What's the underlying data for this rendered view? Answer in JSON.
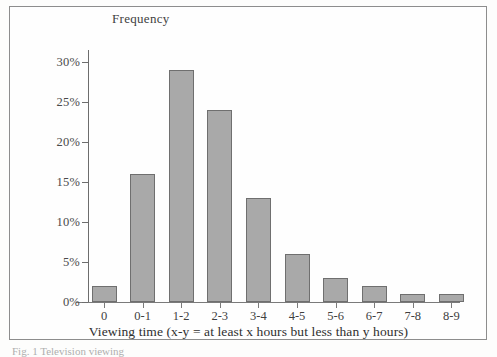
{
  "figure": {
    "y_axis_title": "Frequency",
    "x_axis_title": "Viewing time (x-y = at least x hours but less than y hours)",
    "caption_fragment": "Fig. 1  Television viewing",
    "bar_fill_color": "#a9a9a9",
    "bar_border_color": "#6f6f6f",
    "axis_color": "#6d6d6d",
    "frame_color": "#8d8d8d"
  },
  "chart_data": {
    "type": "bar",
    "title": "",
    "xlabel": "Viewing time (x-y = at least x hours but less than y hours)",
    "ylabel": "Frequency",
    "categories": [
      "0",
      "0-1",
      "1-2",
      "2-3",
      "3-4",
      "4-5",
      "5-6",
      "6-7",
      "7-8",
      "8-9"
    ],
    "values": [
      2,
      16,
      29,
      24,
      13,
      6,
      3,
      2,
      1,
      1
    ],
    "value_labels": [
      "2%",
      "16%",
      "29%",
      "24%",
      "13%",
      "6%",
      "3%",
      "2%",
      "1%",
      "1%"
    ],
    "ylim": [
      0,
      30
    ],
    "yticks": [
      0,
      5,
      10,
      15,
      20,
      25,
      30
    ],
    "ytick_labels": [
      "0%",
      "5%",
      "10%",
      "15%",
      "20%",
      "25%",
      "30%"
    ],
    "grid": false,
    "legend": false
  }
}
